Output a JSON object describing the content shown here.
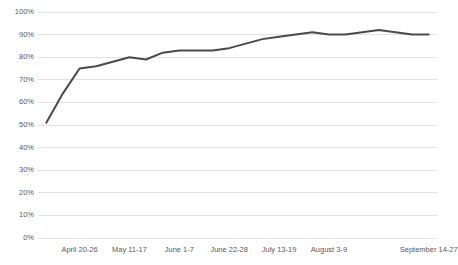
{
  "chart": {
    "title": "",
    "line_color": "#4a4a4a",
    "gridline_color": "#e2e2e2",
    "label_color": "#5a5a5a",
    "background": "#ffffff"
  },
  "chart_data": {
    "type": "line",
    "title": "",
    "xlabel": "",
    "ylabel": "",
    "ylim": [
      0,
      100
    ],
    "ytick_labels": [
      "100%",
      "90%",
      "80%",
      "70%",
      "60%",
      "50%",
      "40%",
      "30%",
      "20%",
      "10%",
      "0%"
    ],
    "ytick_values": [
      100,
      90,
      80,
      70,
      60,
      50,
      40,
      30,
      20,
      10,
      0
    ],
    "grid": true,
    "legend": "none",
    "x_axis_type": "weekly date ranges",
    "categories": [
      "April 6-12",
      "April 13-19",
      "April 20-26",
      "April 27 - May 3",
      "May 4-10",
      "May 11-17",
      "May 18-24",
      "May 25-31",
      "June 1-7",
      "June 8-14",
      "June 15-21",
      "June 22-28",
      "June 29 - July 5",
      "July 6-12",
      "July 13-19",
      "July 20-26",
      "July 27 - August 2",
      "August 3-9",
      "August 10-16",
      "August 17-23",
      "August 24-30",
      "August 31 - September 6",
      "September 7-13",
      "September 14-27"
    ],
    "labeled_ticks": [
      "April 20-26",
      "May 11-17",
      "June 1-7",
      "June 22-28",
      "July 13-19",
      "August 3-9",
      "September 14-27"
    ],
    "labeled_tick_indices": [
      2,
      5,
      8,
      11,
      14,
      17,
      23
    ],
    "values": [
      51,
      64,
      75,
      76,
      78,
      80,
      79,
      82,
      83,
      83,
      83,
      84,
      86,
      88,
      89,
      90,
      91,
      90,
      90,
      91,
      92,
      91,
      90,
      90
    ],
    "series": [
      {
        "name": "percentage",
        "values": [
          51,
          64,
          75,
          76,
          78,
          80,
          79,
          82,
          83,
          83,
          83,
          84,
          86,
          88,
          89,
          90,
          91,
          90,
          90,
          91,
          92,
          91,
          90,
          90
        ]
      }
    ]
  }
}
